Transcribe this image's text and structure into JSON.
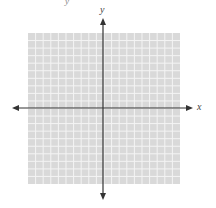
{
  "diagram": {
    "type": "coordinate-plane",
    "x_axis_label": "x",
    "y_axis_label": "y",
    "grid": {
      "cells_x": 20,
      "cells_y": 20,
      "left": 28,
      "top": 33,
      "right": 180,
      "bottom": 184,
      "fill_color": "#d9d9d9",
      "line_color": "#f4f4f4"
    },
    "origin": {
      "x": 103,
      "y": 108
    },
    "axis_color": "#333333",
    "x_axis": {
      "from": 12,
      "to": 193
    },
    "y_axis": {
      "from": 18,
      "to": 200
    },
    "fragment_text": "y"
  }
}
